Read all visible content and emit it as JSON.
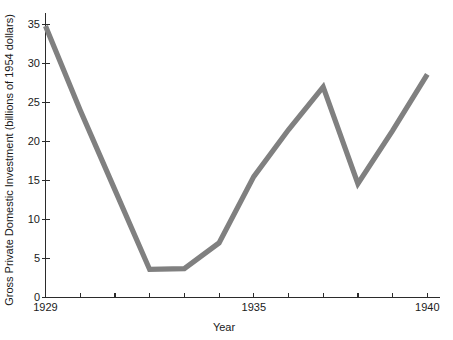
{
  "chart_data": {
    "type": "line",
    "title": "",
    "subtitle": "",
    "xlabel": "Year",
    "ylabel": "Gross Private Domestic Investment (billions of 1954 dollars)",
    "x": [
      1929,
      1930,
      1931,
      1932,
      1933,
      1934,
      1935,
      1936,
      1937,
      1938,
      1939,
      1940
    ],
    "values": [
      34.8,
      24.0,
      13.8,
      3.6,
      3.7,
      7.0,
      15.5,
      21.5,
      27.0,
      14.6,
      21.4,
      28.6
    ],
    "series": [
      {
        "name": "Gross Private Domestic Investment",
        "values": [
          34.8,
          24.0,
          13.8,
          3.6,
          3.7,
          7.0,
          15.5,
          21.5,
          27.0,
          14.6,
          21.4,
          28.6
        ],
        "color": "#808080"
      }
    ],
    "xlim": [
      1929,
      1940
    ],
    "ylim": [
      0,
      36.5
    ],
    "x_tick_values": [
      1929,
      1930,
      1931,
      1932,
      1933,
      1934,
      1935,
      1936,
      1937,
      1938,
      1939,
      1940
    ],
    "x_tick_labels_shown": [
      "1929",
      "1935",
      "1940"
    ],
    "x_tick_labels_shown_values": [
      1929,
      1935,
      1940
    ],
    "y_ticks": [
      0,
      5,
      10,
      15,
      20,
      25,
      30,
      35
    ],
    "y_tick_labels": [
      "0",
      "5",
      "10",
      "15",
      "20",
      "25",
      "30",
      "35"
    ],
    "grid": false,
    "legend": false,
    "legend_position": "none",
    "line_color": "#808080",
    "axis_color": "#2b2b2b",
    "background_color": "#ffffff"
  }
}
